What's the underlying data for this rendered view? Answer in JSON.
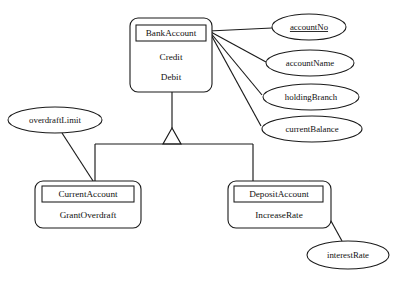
{
  "diagram": {
    "type": "uml-class-generalization",
    "background_color": "#ffffff",
    "line_color": "#1a1a1a",
    "text_color": "#111111",
    "superclass": {
      "name": "BankAccount",
      "attributes": [
        "Credit",
        "Debit"
      ]
    },
    "subclasses": [
      {
        "name": "CurrentAccount",
        "attributes": [
          "GrantOverdraft"
        ]
      },
      {
        "name": "DepositAccount",
        "attributes": [
          "IncreaseRate"
        ]
      }
    ],
    "attribute_ellipses": {
      "bank_account": [
        {
          "label": "accountNo",
          "key": true
        },
        {
          "label": "accountName",
          "key": false
        },
        {
          "label": "holdingBranch",
          "key": false
        },
        {
          "label": "currentBalance",
          "key": false
        }
      ],
      "current_account": [
        {
          "label": "overdraftLimit",
          "key": false
        }
      ],
      "deposit_account": [
        {
          "label": "interestRate",
          "key": false
        }
      ]
    },
    "generalization": {
      "symbol": "hollow-triangle",
      "parent": "BankAccount",
      "children": [
        "CurrentAccount",
        "DepositAccount"
      ]
    }
  }
}
